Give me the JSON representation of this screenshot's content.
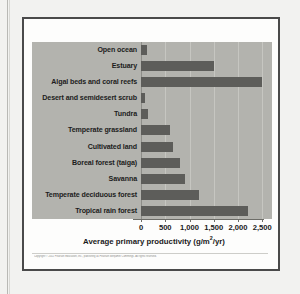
{
  "figure": {
    "copyright": "Copyright © 2011 Pearson Education, Inc., publishing as Pearson Benjamin Cummings. All rights reserved."
  },
  "chart_data": {
    "type": "bar",
    "orientation": "horizontal",
    "title": "",
    "xlabel": "Average primary productivity (g/m2/yr)",
    "xlabel_parts": {
      "pre": "Average primary productivity (g/m",
      "sup": "2",
      "post": "/yr)"
    },
    "ylabel": "",
    "xlim": [
      0,
      2700
    ],
    "xticks": [
      0,
      500,
      1000,
      1500,
      2000,
      2500
    ],
    "xtick_labels": [
      "0",
      "500",
      "1,000",
      "1,500",
      "2,000",
      "2,500"
    ],
    "grid": true,
    "legend": "none",
    "bar_color": "#5d5d5a",
    "plot_background": "#b3b3ae",
    "categories": [
      "Open ocean",
      "Estuary",
      "Algal beds and coral reefs",
      "Desert and semidesert scrub",
      "Tundra",
      "Temperate grassland",
      "Cultivated land",
      "Boreal forest (taiga)",
      "Savanna",
      "Temperate deciduous forest",
      "Tropical rain forest"
    ],
    "values": [
      125,
      1500,
      2500,
      90,
      140,
      600,
      650,
      800,
      900,
      1200,
      2200
    ]
  }
}
